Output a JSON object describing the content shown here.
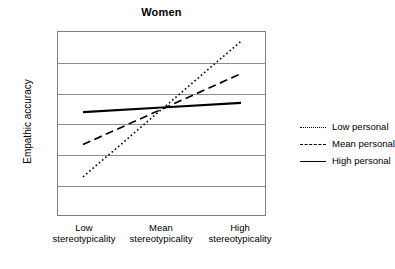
{
  "chart_data": {
    "type": "line",
    "title": "Women",
    "xlabel": "",
    "ylabel": "Empathic accuracy",
    "categories": [
      "Low stereotypicality",
      "Mean stereotypicality",
      "High stereotypicality"
    ],
    "category_lines": [
      {
        "t1": "Low",
        "t2": "stereotypicality"
      },
      {
        "t1": "Mean",
        "t2": "stereotypicality"
      },
      {
        "t1": "High",
        "t2": "stereotypicality"
      }
    ],
    "series": [
      {
        "name": "Low personal",
        "style": "dotted",
        "color": "#000000",
        "values": [
          22.6,
          27.0,
          31.4
        ]
      },
      {
        "name": "Mean personal",
        "style": "dashed",
        "color": "#000000",
        "values": [
          24.7,
          27.0,
          29.3
        ]
      },
      {
        "name": "High personal",
        "style": "solid",
        "color": "#000000",
        "values": [
          26.8,
          27.1,
          27.4
        ]
      }
    ],
    "ylim": [
      20,
      32
    ],
    "yticks": [
      20,
      22,
      24,
      26,
      28,
      30,
      32
    ],
    "ytick_labels": [
      "20",
      "22",
      "24",
      "26",
      "28",
      "30",
      "32"
    ],
    "grid": true,
    "grid_color": "#8c8c8c",
    "legend_position": "right",
    "plot_border_color": "#808080",
    "background": "#ffffff"
  }
}
